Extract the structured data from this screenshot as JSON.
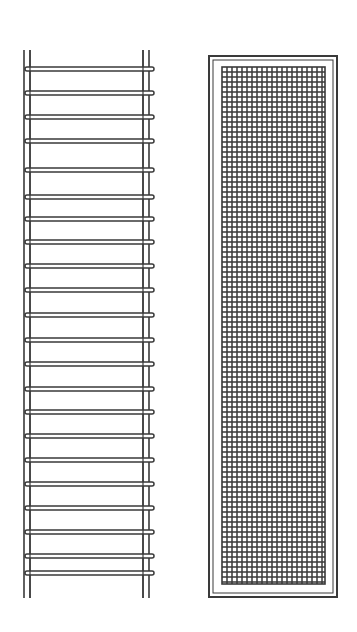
{
  "figure": {
    "width": 357,
    "height": 632,
    "background": "#ffffff",
    "stroke_color": "#3a3a3a"
  },
  "ladder_coil": {
    "label": "",
    "left_rail_outer_x": 24,
    "left_rail_inner_x": 30,
    "right_rail_inner_x": 143,
    "right_rail_outer_x": 149,
    "top_y": 50,
    "bottom_y": 598,
    "rung_left_x": 25,
    "rung_right_x": 154,
    "rung_thickness": 4,
    "rungs_y": [
      69,
      93,
      117,
      141,
      170,
      197,
      219,
      242,
      266,
      290,
      315,
      340,
      364,
      389,
      412,
      436,
      460,
      484,
      508,
      532,
      556,
      573
    ]
  },
  "mesh_panel": {
    "label": "",
    "frame_outer": {
      "x": 209,
      "y": 56,
      "w": 128,
      "h": 541
    },
    "frame_inner": {
      "x": 213,
      "y": 60,
      "w": 120,
      "h": 533
    },
    "mesh": {
      "x": 222,
      "y": 67,
      "w": 103,
      "h": 517,
      "cell": 5
    }
  }
}
